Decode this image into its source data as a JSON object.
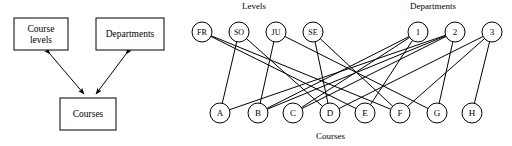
{
  "figure": {
    "left_diagram": {
      "type": "entity-relationship",
      "entities": [
        {
          "id": "course-levels",
          "label_line1": "Course",
          "label_line2": "levels",
          "x": 14,
          "y": 18,
          "w": 54,
          "h": 32
        },
        {
          "id": "departments",
          "label_line1": "Departments",
          "label_line2": "",
          "x": 96,
          "y": 18,
          "w": 68,
          "h": 32
        },
        {
          "id": "courses",
          "label_line1": "Courses",
          "label_line2": "",
          "x": 60,
          "y": 98,
          "w": 56,
          "h": 32
        }
      ],
      "connections": [
        {
          "from": "course-levels",
          "to": "courses",
          "arrow": "both"
        },
        {
          "from": "departments",
          "to": "courses",
          "arrow": "both"
        }
      ]
    },
    "right_diagram": {
      "type": "bipartite-graph",
      "group_labels": {
        "levels": "Levels",
        "departments": "Departments",
        "courses": "Courses"
      },
      "nodes": {
        "levels": [
          {
            "id": "FR",
            "label": "FR",
            "cx": 22,
            "cy": 32,
            "r": 10
          },
          {
            "id": "SO",
            "label": "SO",
            "cx": 59,
            "cy": 32,
            "r": 10
          },
          {
            "id": "JU",
            "label": "JU",
            "cx": 96,
            "cy": 32,
            "r": 10
          },
          {
            "id": "SE",
            "label": "SE",
            "cx": 133,
            "cy": 32,
            "r": 10
          }
        ],
        "departments": [
          {
            "id": "D1",
            "label": "1",
            "cx": 238,
            "cy": 32,
            "r": 10
          },
          {
            "id": "D2",
            "label": "2",
            "cx": 275,
            "cy": 32,
            "r": 10
          },
          {
            "id": "D3",
            "label": "3",
            "cx": 312,
            "cy": 32,
            "r": 10
          }
        ],
        "courses": [
          {
            "id": "A",
            "label": "A",
            "cx": 40,
            "cy": 113,
            "r": 10
          },
          {
            "id": "B",
            "label": "B",
            "cx": 78,
            "cy": 113,
            "r": 10
          },
          {
            "id": "C",
            "label": "C",
            "cx": 113,
            "cy": 113,
            "r": 10
          },
          {
            "id": "D",
            "label": "D",
            "cx": 150,
            "cy": 113,
            "r": 10
          },
          {
            "id": "E",
            "label": "E",
            "cx": 185,
            "cy": 113,
            "r": 10
          },
          {
            "id": "F",
            "label": "F",
            "cx": 220,
            "cy": 113,
            "r": 10
          },
          {
            "id": "G",
            "label": "G",
            "cx": 257,
            "cy": 113,
            "r": 10
          },
          {
            "id": "H",
            "label": "H",
            "cx": 292,
            "cy": 113,
            "r": 10
          }
        ]
      },
      "edges": [
        {
          "from": "FR",
          "to": "E"
        },
        {
          "from": "FR",
          "to": "F"
        },
        {
          "from": "SO",
          "to": "A"
        },
        {
          "from": "SO",
          "to": "D"
        },
        {
          "from": "JU",
          "to": "B"
        },
        {
          "from": "JU",
          "to": "G"
        },
        {
          "from": "SE",
          "to": "D"
        },
        {
          "from": "SE",
          "to": "F"
        },
        {
          "from": "D1",
          "to": "B"
        },
        {
          "from": "D1",
          "to": "C"
        },
        {
          "from": "D1",
          "to": "E"
        },
        {
          "from": "D2",
          "to": "A"
        },
        {
          "from": "D2",
          "to": "B"
        },
        {
          "from": "D2",
          "to": "C"
        },
        {
          "from": "D2",
          "to": "G"
        },
        {
          "from": "D3",
          "to": "D"
        },
        {
          "from": "D3",
          "to": "F"
        },
        {
          "from": "D3",
          "to": "H"
        }
      ]
    }
  },
  "style": {
    "stroke": "#000000",
    "fill": "#ffffff",
    "stroke_width": 1
  }
}
